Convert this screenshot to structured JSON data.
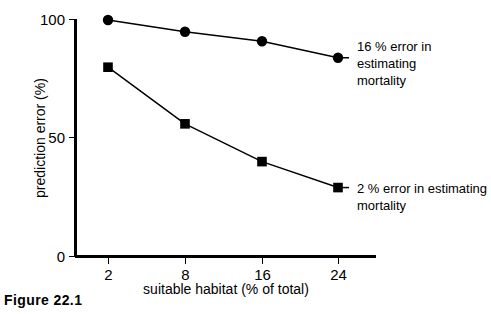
{
  "caption": "Figure 22.1",
  "chart_data": {
    "type": "line",
    "title": "",
    "xlabel": "suitable habitat (% of total)",
    "ylabel": "prediction error (%)",
    "categories": [
      "2",
      "8",
      "16",
      "24"
    ],
    "x_tick_labels": [
      "2",
      "8",
      "16",
      "24"
    ],
    "y_tick_labels": [
      "0",
      "50",
      "100"
    ],
    "y_ticks": [
      0,
      50,
      100
    ],
    "ylim": [
      0,
      100
    ],
    "grid": false,
    "legend": "annotations at right of each series",
    "series": [
      {
        "name": "16 % error in estimating mortality",
        "marker": "circle",
        "values": [
          100,
          95,
          91,
          84
        ],
        "annotation_line_1": "16 % error in estimating",
        "annotation_line_2": "mortality"
      },
      {
        "name": "2 % error in estimating mortality",
        "marker": "square",
        "values": [
          80,
          56,
          40,
          29
        ],
        "annotation_line_1": "2 % error in estimating",
        "annotation_line_2": "mortality"
      }
    ],
    "colors": {
      "line": "#000000",
      "marker": "#000000",
      "axis": "#000000",
      "background": "#ffffff"
    }
  }
}
